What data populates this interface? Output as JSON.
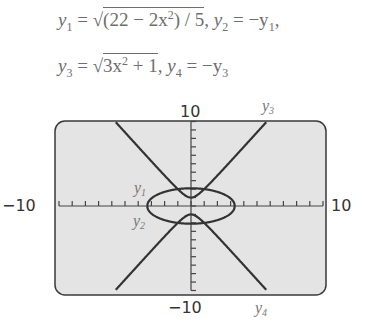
{
  "equations": {
    "line1": {
      "y1_lhs": "y",
      "y1_sub": "1",
      "y1_rad_a": "(22 − 2x",
      "y1_rad_sup": "2",
      "y1_rad_b": ") / 5",
      "sep1": ", ",
      "y2_lhs": "y",
      "y2_sub": "2",
      "y2_rhs": " = −y",
      "y2_rhs_sub": "1",
      "tail": ","
    },
    "line2": {
      "y3_lhs": "y",
      "y3_sub": "3",
      "y3_rad_a": "3x",
      "y3_rad_sup": "2",
      "y3_rad_b": " + 1",
      "sep": ", ",
      "y4_lhs": "y",
      "y4_sub": "4",
      "y4_rhs": " = −y",
      "y4_rhs_sub": "3"
    }
  },
  "chart_data": {
    "type": "line",
    "title": "",
    "xlabel": "",
    "ylabel": "",
    "xlim": [
      -10,
      10
    ],
    "ylim": [
      -10,
      10
    ],
    "x_tick_step": 1,
    "y_tick_step": 1,
    "tick_labels": {
      "x_min": "−10",
      "x_max": "10",
      "y_min": "−10",
      "y_max": "10"
    },
    "series": [
      {
        "name": "y1",
        "formula": "sqrt((22 - 2x^2)/5)",
        "domain": [
          -3.317,
          3.317
        ],
        "label": "y1"
      },
      {
        "name": "y2",
        "formula": "-sqrt((22 - 2x^2)/5)",
        "domain": [
          -3.317,
          3.317
        ],
        "label": "y2"
      },
      {
        "name": "y3",
        "formula": "sqrt(3x^2 + 1)",
        "domain": [
          -5.7,
          5.7
        ],
        "label": "y3"
      },
      {
        "name": "y4",
        "formula": "-sqrt(3x^2 + 1)",
        "domain": [
          -5.7,
          5.7
        ],
        "label": "y4"
      }
    ],
    "grid": false
  },
  "labels": {
    "y1": "y",
    "y1s": "1",
    "y2": "y",
    "y2s": "2",
    "y3": "y",
    "y3s": "3",
    "y4": "y",
    "y4s": "4"
  },
  "colors": {
    "screen": "#e4e4e4",
    "frame": "#3a3a3a",
    "curve": "#333333",
    "axis": "#444444"
  }
}
